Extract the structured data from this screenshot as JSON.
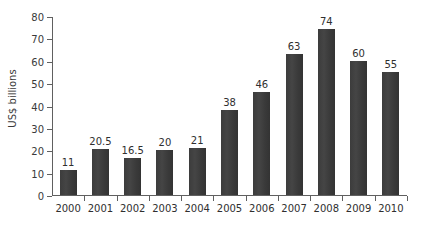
{
  "chart_data": {
    "type": "bar",
    "title": "",
    "subtitle": "",
    "xlabel": "",
    "ylabel": "US$ billions",
    "categories": [
      "2000",
      "2001",
      "2002",
      "2003",
      "2004",
      "2005",
      "2006",
      "2007",
      "2008",
      "2009",
      "2010"
    ],
    "values": [
      11,
      20.5,
      16.5,
      20,
      21,
      38,
      46,
      63,
      74,
      60,
      55
    ],
    "value_labels": [
      "11",
      "20.5",
      "16.5",
      "20",
      "21",
      "38",
      "46",
      "63",
      "74",
      "60",
      "55"
    ],
    "ylim": [
      0,
      80
    ],
    "yticks": [
      0,
      10,
      20,
      30,
      40,
      50,
      60,
      70,
      80
    ],
    "ytick_labels": [
      "0",
      "10",
      "20",
      "30",
      "40",
      "50",
      "60",
      "70",
      "80"
    ],
    "grid": false,
    "legend": null,
    "legend_position": "none",
    "bar_color": "#3f3f3f",
    "axis_color": "#606060",
    "background_color": "#ffffff",
    "text_color": "#2f2f2f"
  }
}
